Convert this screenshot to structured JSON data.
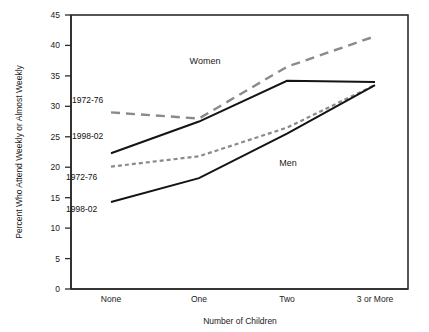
{
  "chart_data": {
    "type": "line",
    "title": "",
    "subtitle": "",
    "xlabel": "Number of Children",
    "ylabel": "Percent Who Attend Weekly or Almost Weekly",
    "categories": [
      "None",
      "One",
      "Two",
      "3 or More"
    ],
    "ylim": [
      0,
      45
    ],
    "yticks": [
      0,
      5,
      10,
      15,
      20,
      25,
      30,
      35,
      40,
      45
    ],
    "ytick_labels": [
      "0",
      "5",
      "10",
      "15",
      "20",
      "25",
      "30",
      "35",
      "40",
      "45"
    ],
    "grid": false,
    "legend_position": "inline-annotations",
    "series": [
      {
        "name": "Women 1972-76",
        "group": "Women",
        "period": "1972-76",
        "style": "long-dashed",
        "color": "#8a8a8a",
        "values": [
          29.0,
          28.0,
          36.5,
          41.5
        ]
      },
      {
        "name": "Women 1998-02",
        "group": "Women",
        "period": "1998-02",
        "style": "solid",
        "color": "#141414",
        "values": [
          22.3,
          27.5,
          34.2,
          34.0
        ]
      },
      {
        "name": "Men 1972-76",
        "group": "Men",
        "period": "1972-76",
        "style": "short-dashed",
        "color": "#8a8a8a",
        "values": [
          20.1,
          21.8,
          26.5,
          33.5
        ]
      },
      {
        "name": "Men 1998-02",
        "group": "Men",
        "period": "1998-02",
        "style": "solid",
        "color": "#141414",
        "values": [
          14.3,
          18.2,
          25.5,
          33.5
        ]
      }
    ],
    "annotations": [
      {
        "id": "women-group",
        "text": "Women"
      },
      {
        "id": "men-group",
        "text": "Men"
      },
      {
        "id": "women-1972",
        "text": "1972-76"
      },
      {
        "id": "women-1998",
        "text": "1998-02"
      },
      {
        "id": "men-1972",
        "text": "1972-76"
      },
      {
        "id": "men-1998",
        "text": "1998-02"
      }
    ]
  }
}
